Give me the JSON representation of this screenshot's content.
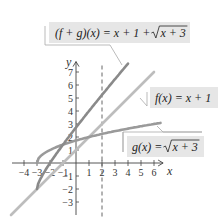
{
  "chart_data": {
    "type": "line",
    "title": "",
    "xlabel": "x",
    "ylabel": "y",
    "xlim": [
      -4.5,
      7
    ],
    "ylim": [
      -4,
      8
    ],
    "grid": false,
    "x_ticks": [
      -4,
      -3,
      -2,
      -1,
      1,
      2,
      3,
      4,
      5,
      6
    ],
    "y_ticks": [
      -3,
      -2,
      -1,
      1,
      2,
      3,
      4,
      5,
      6,
      7
    ],
    "x_tick_labels": [
      "−4",
      "−3",
      "−2",
      "−1",
      "1",
      "2",
      "3",
      "4",
      "5",
      "6"
    ],
    "y_tick_labels": [
      "−3",
      "−2",
      "−1",
      "1",
      "2",
      "3",
      "4",
      "5",
      "6",
      "7"
    ],
    "series": [
      {
        "name": "(f + g)(x) = x + 1 + √(x + 3)",
        "color": "#8a8a8a",
        "domain": [
          -3,
          4
        ],
        "x": [
          -3,
          -2,
          -1,
          0,
          1,
          2,
          3,
          4
        ],
        "y": [
          -2,
          0,
          1.41,
          2.73,
          4,
          5.24,
          6.45,
          7.65
        ]
      },
      {
        "name": "f(x) = x + 1",
        "color": "#bdbdbd",
        "domain": [
          -5,
          6
        ],
        "x": [
          -5,
          6
        ],
        "y": [
          -4,
          7
        ]
      },
      {
        "name": "g(x) = √(x + 3)",
        "color": "#9a9a9a",
        "domain": [
          -3,
          6.5
        ],
        "x": [
          -3,
          -2,
          -1,
          0,
          1,
          2,
          3,
          4,
          5,
          6,
          6.5
        ],
        "y": [
          0,
          1,
          1.41,
          1.73,
          2,
          2.24,
          2.45,
          2.65,
          2.83,
          3,
          3.08
        ]
      }
    ],
    "annotations": [
      {
        "type": "vertical_dashed_line",
        "x": 2
      },
      {
        "type": "callout",
        "text": "(f + g)(x) = x + 1 + √(x + 3)",
        "target_series": 0
      },
      {
        "type": "callout",
        "text": "f(x) = x + 1",
        "target_series": 1
      },
      {
        "type": "callout",
        "text": "g(x) = √(x + 3)",
        "target_series": 2
      }
    ]
  },
  "labels": {
    "x_axis": "x",
    "y_axis": "y",
    "fg_callout": "(f + g)(x) = x + 1 + ",
    "fg_callout_radicand": "x + 3",
    "f_callout": "f(x) = x + 1",
    "g_callout": "g(x) = ",
    "g_callout_radicand": "x + 3"
  }
}
